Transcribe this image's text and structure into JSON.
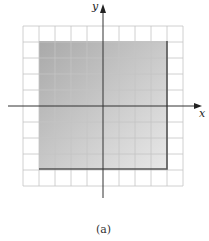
{
  "figure": {
    "caption": "(a)",
    "x_axis_label": "x",
    "y_axis_label": "y",
    "grid": {
      "columns": 10,
      "rows": 10,
      "cell_px": 16,
      "line_color": "#c8c8c8"
    },
    "shaded_region": {
      "description": "rectangle with gradient shading, dark lower and right borders",
      "fill_from": "#a9a9a9",
      "fill_to": "#e6e6e6",
      "border_color": "#555555"
    },
    "axis_color": "#333333"
  }
}
